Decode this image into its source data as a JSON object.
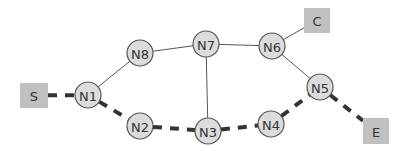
{
  "diagram": {
    "type": "graph",
    "terminals": [
      {
        "id": "S",
        "label": "S",
        "x": 20,
        "y": 83,
        "w": 28,
        "h": 25
      },
      {
        "id": "C",
        "label": "C",
        "x": 304,
        "y": 8,
        "w": 26,
        "h": 25
      },
      {
        "id": "E",
        "label": "E",
        "x": 363,
        "y": 118,
        "w": 26,
        "h": 26
      }
    ],
    "nodes": [
      {
        "id": "N1",
        "label": "N1",
        "cx": 88,
        "cy": 95
      },
      {
        "id": "N2",
        "label": "N2",
        "cx": 140,
        "cy": 126
      },
      {
        "id": "N3",
        "label": "N3",
        "cx": 208,
        "cy": 131
      },
      {
        "id": "N4",
        "label": "N4",
        "cx": 271,
        "cy": 124
      },
      {
        "id": "N5",
        "label": "N5",
        "cx": 320,
        "cy": 87
      },
      {
        "id": "N6",
        "label": "N6",
        "cx": 272,
        "cy": 46
      },
      {
        "id": "N7",
        "label": "N7",
        "cx": 206,
        "cy": 44
      },
      {
        "id": "N8",
        "label": "N8",
        "cx": 140,
        "cy": 53
      }
    ],
    "edges": [
      {
        "from": "N1",
        "to": "N8",
        "style": "thin"
      },
      {
        "from": "N8",
        "to": "N7",
        "style": "thin"
      },
      {
        "from": "N7",
        "to": "N6",
        "style": "thin"
      },
      {
        "from": "N7",
        "to": "N3",
        "style": "thin"
      },
      {
        "from": "N6",
        "to": "C",
        "style": "thin"
      },
      {
        "from": "N6",
        "to": "N5",
        "style": "thin"
      },
      {
        "from": "S",
        "to": "N1",
        "style": "path"
      },
      {
        "from": "N1",
        "to": "N2",
        "style": "path"
      },
      {
        "from": "N2",
        "to": "N3",
        "style": "path"
      },
      {
        "from": "N3",
        "to": "N4",
        "style": "path"
      },
      {
        "from": "N4",
        "to": "N5",
        "style": "path"
      },
      {
        "from": "N5",
        "to": "E",
        "style": "path"
      }
    ],
    "node_radius": 13,
    "colors": {
      "node_fill": "#dcdcdc",
      "node_stroke": "#555555",
      "box_fill": "#c0c0c0",
      "thin_edge": "#555555",
      "path_edge": "#333333"
    }
  }
}
